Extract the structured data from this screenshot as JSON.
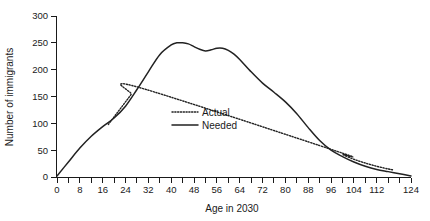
{
  "chart_data": {
    "type": "line",
    "title": "",
    "xlabel": "Age in 2030",
    "ylabel": "Number of immigrants",
    "xlim": [
      0,
      124
    ],
    "ylim": [
      0,
      300
    ],
    "grid": false,
    "legend_position": "center",
    "x_ticks_major": [
      0,
      8,
      16,
      24,
      32,
      40,
      48,
      56,
      64,
      72,
      80,
      88,
      96,
      104,
      112,
      120
    ],
    "x_tick_labels": [
      "0",
      "8",
      "16",
      "24",
      "32",
      "40",
      "48",
      "56",
      "64",
      "72",
      "80",
      "88",
      "96",
      "104",
      "112",
      "124"
    ],
    "x_tick_label_values": [
      0,
      8,
      16,
      24,
      32,
      40,
      48,
      56,
      64,
      72,
      80,
      88,
      96,
      104,
      112,
      124
    ],
    "x_minor_tick_step": 4,
    "y_ticks": [
      0,
      50,
      100,
      150,
      200,
      250,
      300
    ],
    "y_tick_labels": [
      "0",
      "50",
      "100",
      "150",
      "200",
      "250",
      "300"
    ],
    "series": [
      {
        "name": "Actual",
        "style": "dotted",
        "color": "#222222",
        "x": [
          18,
          20,
          22,
          24,
          26,
          28,
          98,
          100,
          104,
          108,
          112,
          116,
          118
        ],
        "values": [
          98,
          112,
          126,
          140,
          154,
          168,
          48,
          42,
          33,
          26,
          20,
          15,
          13
        ]
      },
      {
        "name": "Needed",
        "style": "solid",
        "color": "#222222",
        "x": [
          0,
          4,
          8,
          12,
          16,
          20,
          24,
          28,
          32,
          36,
          40,
          42,
          44,
          46,
          48,
          50,
          52,
          54,
          56,
          58,
          60,
          62,
          64,
          68,
          72,
          76,
          80,
          84,
          88,
          92,
          96,
          100,
          104,
          108,
          112,
          116,
          120,
          124
        ],
        "values": [
          2,
          28,
          54,
          76,
          94,
          110,
          132,
          163,
          196,
          228,
          246,
          250,
          250,
          248,
          243,
          238,
          235,
          237,
          240,
          240,
          236,
          229,
          219,
          196,
          175,
          158,
          140,
          118,
          92,
          68,
          50,
          38,
          28,
          20,
          14,
          10,
          6,
          2
        ]
      }
    ],
    "legend_entries": [
      {
        "label": "Actual",
        "style": "dotted"
      },
      {
        "label": "Needed",
        "style": "solid"
      }
    ]
  }
}
